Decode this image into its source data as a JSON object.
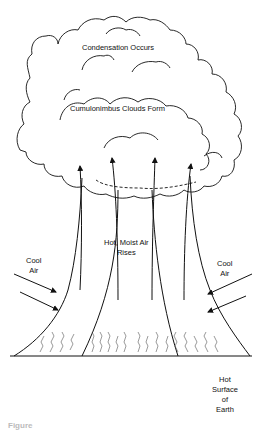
{
  "diagram": {
    "type": "convection-cloud-formation",
    "labels": {
      "condensation": "Condensation Occurs",
      "cumulonimbus": "Cumulonimbus Clouds Form",
      "rising_air_line1": "Hot, Moist Air",
      "rising_air_line2": "Rises",
      "cool_air_left_line1": "Cool",
      "cool_air_left_line2": "Air",
      "cool_air_right_line1": "Cool",
      "cool_air_right_line2": "Air",
      "surface_line1": "Hot",
      "surface_line2": "Surface",
      "surface_line3": "of",
      "surface_line4": "Earth"
    },
    "caption": "Figure",
    "arrows": {
      "upward_count": 4,
      "inflow_left_count": 2,
      "inflow_right_count": 2
    },
    "colors": {
      "line": "#111111",
      "background": "#ffffff"
    }
  }
}
